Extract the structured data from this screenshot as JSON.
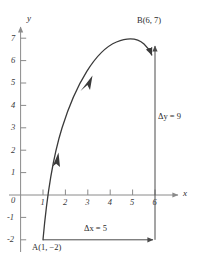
{
  "figure": {
    "type": "coordinate-plane-curve-diagram",
    "axes": {
      "x_name": "x",
      "y_name": "y",
      "x_ticks": [
        "1",
        "2",
        "3",
        "4",
        "5",
        "6"
      ],
      "y_ticks": [
        "7",
        "6",
        "5",
        "4",
        "3",
        "2",
        "1",
        "0",
        "-1",
        "-2"
      ],
      "origin_label": "0"
    },
    "points": [
      {
        "id": "A",
        "label": "A(1, −2)",
        "x": 1,
        "y": -2
      },
      {
        "id": "B",
        "label": "B(6, 7)",
        "x": 6,
        "y": 7
      }
    ],
    "annotations": [
      {
        "id": "dx",
        "label": "Δx = 5",
        "value": 5
      },
      {
        "id": "dy",
        "label": "Δy = 9",
        "value": 9
      }
    ],
    "curve": {
      "description": "oriented arc from A(1,-2) rising to peak near (5.2, 7.2) then to B(6,7)",
      "direction_arrows": 2
    },
    "colors": {
      "axis": "#8a8a8a",
      "curve": "#3a3a3a",
      "annotation": "#4a4a4a",
      "text": "#2b2b2b",
      "background": "#ffffff"
    }
  }
}
